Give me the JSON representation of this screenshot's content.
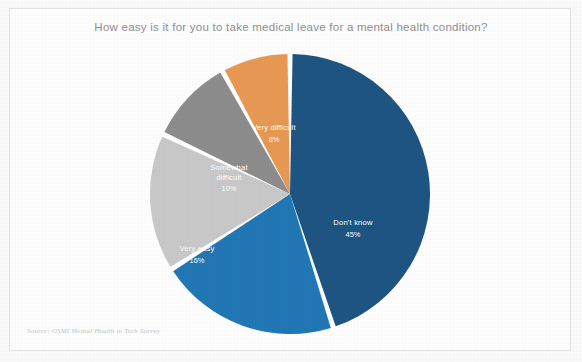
{
  "slide": {
    "source_note": "Source: OSMI Mental Health in Tech Survey"
  },
  "chart_data": {
    "type": "pie",
    "title": "How easy is it for you to take medical leave for a mental health condition?",
    "xlabel": "",
    "ylabel": "",
    "legend": "none",
    "grid": false,
    "start_angle_deg": 0,
    "direction": "clockwise",
    "units": "percent",
    "total": 100,
    "categories": [
      "Don't know",
      "Somewhat easy",
      "Very easy",
      "Somewhat difficult",
      "Very difficult"
    ],
    "values": [
      45,
      21,
      16,
      10,
      8
    ],
    "labels": [
      "45%",
      "21%",
      "16%",
      "10%",
      "8%"
    ],
    "colors": [
      "#1f5582",
      "#2277b5",
      "#c9c9c9",
      "#8d8d8d",
      "#e89a55"
    ],
    "slices": [
      {
        "name": "Don't know",
        "value": 45,
        "label": "45%",
        "color": "#1f5582",
        "label_x": 212,
        "label_y": 173,
        "pct_x": 212,
        "pct_y": 185
      },
      {
        "name": "Somewhat easy",
        "value": 21,
        "label": "21%",
        "color": "#2277b5",
        "label_x": 123,
        "label_y": 290,
        "pct_x": 123,
        "pct_y": 302
      },
      {
        "name": "Very easy",
        "value": 16,
        "label": "16%",
        "color": "#c9c9c9",
        "label_x": 56,
        "label_y": 199,
        "pct_x": 56,
        "pct_y": 211
      },
      {
        "name": "Somewhat difficult",
        "value": 10,
        "label": "10%",
        "color": "#8d8d8d",
        "label_x": 88,
        "label_y": 118,
        "pct_x": 88,
        "pct_y": 139
      },
      {
        "name": "Very difficult",
        "value": 8,
        "label": "8%",
        "color": "#e89a55",
        "label_x": 133,
        "label_y": 78,
        "pct_x": 133,
        "pct_y": 90
      }
    ]
  }
}
